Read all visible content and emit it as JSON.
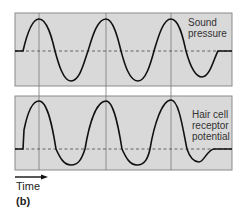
{
  "figure": {
    "part_label": "(b)",
    "time_axis_label": "Time",
    "panels": [
      {
        "id": "sound-pressure",
        "label_lines": [
          "Sound",
          "pressure"
        ]
      },
      {
        "id": "receptor-potential",
        "label_lines": [
          "Hair cell",
          "receptor",
          "potential"
        ]
      }
    ],
    "colors": {
      "panel_fill": "#d9d9d9",
      "panel_border": "#8a8a8a",
      "wave": "#111111",
      "baseline_dashed": "#555555",
      "gridline": "#7a7a7a"
    }
  }
}
